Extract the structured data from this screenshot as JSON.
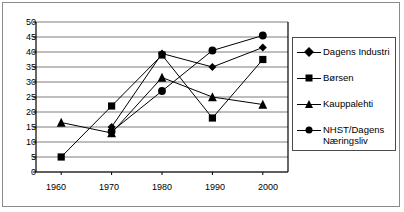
{
  "chart_data": {
    "type": "line",
    "title": "",
    "xlabel": "",
    "ylabel": "",
    "categories": [
      "1960",
      "1970",
      "1980",
      "1990",
      "2000"
    ],
    "x": [
      1960,
      1970,
      1980,
      1990,
      2000
    ],
    "ylim": [
      0,
      50
    ],
    "xlim": [
      1955,
      2005
    ],
    "ytick_labels": [
      "0",
      "5",
      "10",
      "15",
      "20",
      "25",
      "30",
      "35",
      "40",
      "45",
      "50"
    ],
    "yticks": [
      0,
      5,
      10,
      15,
      20,
      25,
      30,
      35,
      40,
      45,
      50
    ],
    "xtick_labels": [
      "1960",
      "1970",
      "1980",
      "1990",
      "2000"
    ],
    "grid": "horizontal",
    "legend_position": "right",
    "series": [
      {
        "name": "Dagens Industri",
        "marker": "diamond",
        "color": "#000000",
        "x": [
          1970,
          1980,
          1990,
          2000
        ],
        "values": [
          15,
          39.5,
          35,
          41.5
        ]
      },
      {
        "name": "Børsen",
        "marker": "square",
        "color": "#000000",
        "x": [
          1960,
          1970,
          1980,
          1990,
          2000
        ],
        "values": [
          5,
          22,
          39,
          18,
          37.5
        ]
      },
      {
        "name": "Kauppalehti",
        "marker": "triangle",
        "color": "#000000",
        "x": [
          1960,
          1970,
          1980,
          1990,
          2000
        ],
        "values": [
          16.5,
          13,
          31.5,
          25,
          22.5
        ]
      },
      {
        "name": "NHST/Dagens Næringsliv",
        "marker": "circle",
        "color": "#000000",
        "x": [
          1970,
          1980,
          1990,
          2000
        ],
        "values": [
          13.5,
          27,
          40.5,
          45.5
        ]
      }
    ]
  },
  "legend": {
    "entries": [
      {
        "label": "Dagens Industri",
        "marker": "diamond"
      },
      {
        "label": "Børsen",
        "marker": "square"
      },
      {
        "label": "Kauppalehti",
        "marker": "triangle"
      },
      {
        "label": "NHST/Dagens",
        "label2": "Næringsliv",
        "marker": "circle"
      }
    ]
  },
  "axes": {
    "y_labels": [
      "50",
      "45",
      "40",
      "35",
      "30",
      "25",
      "20",
      "15",
      "10",
      "5",
      "0"
    ],
    "x_labels": [
      "1960",
      "1970",
      "1980",
      "1990",
      "2000"
    ]
  },
  "colors": {
    "ink": "#000000",
    "frame": "#8a8a8a",
    "grid": "#5a5a5a",
    "background": "#ffffff"
  }
}
